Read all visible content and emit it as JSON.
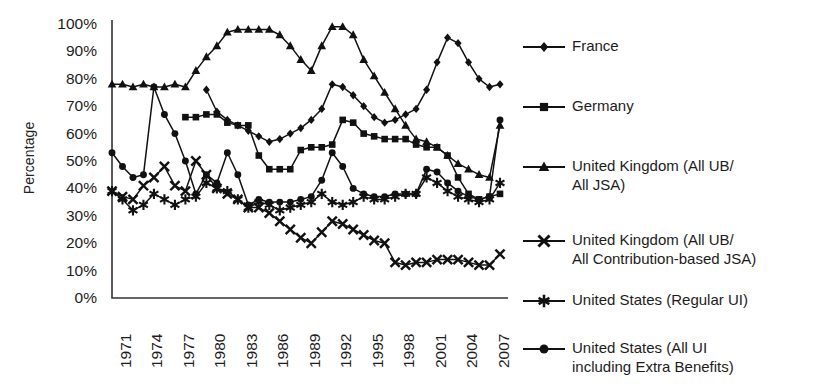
{
  "chart_data": {
    "type": "line",
    "title": "",
    "xlabel": "",
    "ylabel": "Percentage",
    "xlim": [
      1971,
      2008
    ],
    "ylim": [
      0,
      100
    ],
    "grid": false,
    "legend_position": "right",
    "y_ticks": [
      "0%",
      "10%",
      "20%",
      "30%",
      "40%",
      "50%",
      "60%",
      "70%",
      "80%",
      "90%",
      "100%"
    ],
    "y_tick_values": [
      0,
      10,
      20,
      30,
      40,
      50,
      60,
      70,
      80,
      90,
      100
    ],
    "x_ticks": [
      "1971",
      "1974",
      "1977",
      "1980",
      "1983",
      "1986",
      "1989",
      "1992",
      "1995",
      "1998",
      "2001",
      "2004",
      "2007"
    ],
    "x_tick_values": [
      1971,
      1974,
      1977,
      1980,
      1983,
      1986,
      1989,
      1992,
      1995,
      1998,
      2001,
      2004,
      2007
    ],
    "series": [
      {
        "name": "France",
        "marker": "diamond",
        "x": [
          1980,
          1981,
          1982,
          1983,
          1984,
          1985,
          1986,
          1987,
          1988,
          1989,
          1990,
          1991,
          1992,
          1993,
          1994,
          1995,
          1996,
          1997,
          1998,
          1999,
          2000,
          2001,
          2002,
          2003,
          2004,
          2005,
          2006,
          2007,
          2008
        ],
        "values": [
          76,
          68,
          65,
          63,
          61,
          59,
          57,
          58,
          60,
          62,
          65,
          69,
          78,
          77,
          74,
          70,
          66,
          64,
          65,
          67,
          69,
          76,
          86,
          95,
          93,
          86,
          80,
          77,
          78
        ]
      },
      {
        "name": "Germany",
        "marker": "square",
        "x": [
          1978,
          1979,
          1980,
          1981,
          1982,
          1983,
          1984,
          1985,
          1986,
          1987,
          1988,
          1989,
          1990,
          1991,
          1992,
          1993,
          1994,
          1995,
          1996,
          1997,
          1998,
          1999,
          2000,
          2001,
          2002,
          2003,
          2004,
          2005,
          2006,
          2007,
          2008
        ],
        "values": [
          66,
          66,
          67,
          67,
          64,
          63,
          63,
          52,
          47,
          47,
          47,
          54,
          55,
          55,
          56,
          65,
          64,
          60,
          59,
          58,
          58,
          58,
          56,
          55,
          55,
          52,
          44,
          38,
          36,
          37,
          38
        ]
      },
      {
        "name": "United Kingdom (All UB/\nAll JSA)",
        "marker": "triangle",
        "x": [
          1971,
          1972,
          1973,
          1974,
          1975,
          1976,
          1977,
          1978,
          1979,
          1980,
          1981,
          1982,
          1983,
          1984,
          1985,
          1986,
          1987,
          1988,
          1989,
          1990,
          1991,
          1992,
          1993,
          1994,
          1995,
          1996,
          1997,
          1998,
          1999,
          2000,
          2001,
          2002,
          2003,
          2004,
          2005,
          2006,
          2007,
          2008
        ],
        "values": [
          78,
          78,
          77,
          78,
          77,
          77,
          78,
          77,
          83,
          88,
          92,
          97,
          98,
          98,
          98,
          98,
          96,
          92,
          87,
          83,
          92,
          99,
          99,
          96,
          87,
          81,
          75,
          69,
          63,
          58,
          57,
          55,
          52,
          49,
          47,
          45,
          44,
          63
        ]
      },
      {
        "name": "United Kingdom (All UB/\nAll Contribution-based JSA)",
        "marker": "x",
        "x": [
          1971,
          1972,
          1973,
          1974,
          1975,
          1976,
          1977,
          1978,
          1979,
          1980,
          1981,
          1982,
          1983,
          1984,
          1985,
          1986,
          1987,
          1988,
          1989,
          1990,
          1991,
          1992,
          1993,
          1994,
          1995,
          1996,
          1997,
          1998,
          1999,
          2000,
          2001,
          2002,
          2003,
          2004,
          2005,
          2006,
          2007,
          2008
        ],
        "values": [
          39,
          37,
          36,
          41,
          44,
          48,
          41,
          39,
          50,
          45,
          40,
          38,
          36,
          33,
          33,
          31,
          28,
          25,
          22,
          20,
          24,
          28,
          27,
          25,
          23,
          21,
          20,
          13,
          12,
          13,
          13,
          14,
          14,
          14,
          13,
          12,
          12,
          16
        ]
      },
      {
        "name": "United States (Regular UI)",
        "marker": "asterisk",
        "x": [
          1971,
          1972,
          1973,
          1974,
          1975,
          1976,
          1977,
          1978,
          1979,
          1980,
          1981,
          1982,
          1983,
          1984,
          1985,
          1986,
          1987,
          1988,
          1989,
          1990,
          1991,
          1992,
          1993,
          1994,
          1995,
          1996,
          1997,
          1998,
          1999,
          2000,
          2001,
          2002,
          2003,
          2004,
          2005,
          2006,
          2007,
          2008
        ],
        "values": [
          39,
          36,
          32,
          34,
          38,
          36,
          34,
          36,
          37,
          42,
          40,
          39,
          36,
          33,
          35,
          34,
          32,
          33,
          34,
          35,
          38,
          35,
          34,
          35,
          37,
          36,
          36,
          37,
          38,
          38,
          44,
          42,
          39,
          37,
          36,
          35,
          36,
          42
        ]
      },
      {
        "name": "United States (All UI\nincluding Extra Benefits)",
        "marker": "circle",
        "x": [
          1971,
          1972,
          1973,
          1974,
          1975,
          1976,
          1977,
          1978,
          1979,
          1980,
          1981,
          1982,
          1983,
          1984,
          1985,
          1986,
          1987,
          1988,
          1989,
          1990,
          1991,
          1992,
          1993,
          1994,
          1995,
          1996,
          1997,
          1998,
          1999,
          2000,
          2001,
          2002,
          2003,
          2004,
          2005,
          2006,
          2007,
          2008
        ],
        "values": [
          53,
          48,
          44,
          45,
          77,
          67,
          60,
          50,
          38,
          45,
          42,
          53,
          45,
          34,
          36,
          35,
          35,
          35,
          36,
          37,
          43,
          53,
          48,
          40,
          38,
          37,
          37,
          38,
          38,
          38,
          47,
          46,
          42,
          39,
          37,
          36,
          37,
          65
        ]
      }
    ]
  },
  "legend": {
    "items": [
      {
        "label": "France",
        "marker": "diamond"
      },
      {
        "label": "Germany",
        "marker": "square"
      },
      {
        "label": "United Kingdom (All UB/\nAll JSA)",
        "marker": "triangle"
      },
      {
        "label": "United Kingdom (All UB/\nAll Contribution-based JSA)",
        "marker": "x"
      },
      {
        "label": "United States (Regular UI)",
        "marker": "asterisk"
      },
      {
        "label": "United States (All UI\nincluding Extra Benefits)",
        "marker": "circle"
      }
    ]
  },
  "colors": {
    "ink": "#111111",
    "background": "#ffffff",
    "axis": "#333333"
  }
}
